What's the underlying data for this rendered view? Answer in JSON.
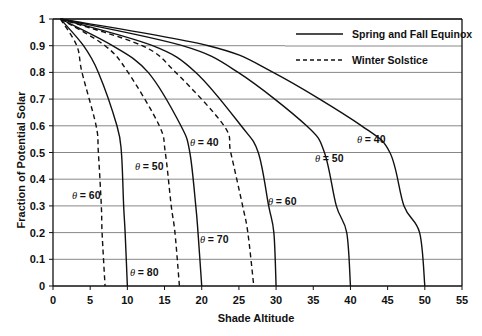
{
  "chart_data": {
    "type": "line",
    "title": "",
    "xlabel": "Shade Altitude",
    "ylabel": "Fraction of Potential Solar",
    "xlim": [
      0,
      55
    ],
    "ylim": [
      0,
      1
    ],
    "xticks": [
      0,
      5,
      10,
      15,
      20,
      25,
      30,
      35,
      40,
      45,
      50,
      55
    ],
    "yticks": [
      0,
      0.1,
      0.2,
      0.3,
      0.4,
      0.5,
      0.6,
      0.7,
      0.8,
      0.9,
      1
    ],
    "ytick_labels": [
      "0",
      "0.1",
      "0.2",
      "0.3",
      "0.4",
      "0.5",
      "0.6",
      "0.7",
      "0.8",
      "0.9",
      "1"
    ],
    "grid": "horizontal",
    "legend_position": "top-right",
    "legend": [
      {
        "label": "Spring and Fall Equinox",
        "style": "solid"
      },
      {
        "label": "Winter Solstice",
        "style": "dashed"
      }
    ],
    "series": [
      {
        "name": "Winter Solstice θ = 60",
        "label": "= 60",
        "style": "dashed",
        "x": [
          1,
          3.2,
          3.9,
          5.8,
          6.1,
          6.5,
          6.6,
          7
        ],
        "y": [
          1,
          0.9,
          0.8,
          0.6,
          0.5,
          0.3,
          0.2,
          0
        ],
        "label_pos": [
          72,
          199
        ]
      },
      {
        "name": "Spring and Fall Equinox θ = 80",
        "label": "= 80",
        "style": "solid",
        "x": [
          1,
          4.1,
          6.1,
          8.6,
          9.2,
          9.5,
          9.7,
          10
        ],
        "y": [
          1,
          0.9,
          0.8,
          0.6,
          0.5,
          0.3,
          0.2,
          0
        ],
        "label_pos": [
          130,
          276
        ]
      },
      {
        "name": "Winter Solstice θ = 50",
        "label": "= 50",
        "style": "dashed",
        "x": [
          1,
          7,
          10.1,
          14.3,
          15.1,
          15.9,
          16.4,
          17
        ],
        "y": [
          1,
          0.9,
          0.8,
          0.6,
          0.5,
          0.3,
          0.2,
          0
        ],
        "label_pos": [
          135,
          170
        ]
      },
      {
        "name": "Spring and Fall Equinox θ = 70",
        "label": "= 70",
        "style": "solid",
        "x": [
          1,
          8,
          12.8,
          17.2,
          18.4,
          19.2,
          19.5,
          20
        ],
        "y": [
          1,
          0.9,
          0.8,
          0.6,
          0.5,
          0.3,
          0.2,
          0
        ],
        "label_pos": [
          200,
          243
        ]
      },
      {
        "name": "Winter Solstice θ = 40",
        "label": "= 40",
        "style": "dashed",
        "x": [
          1,
          12,
          16.5,
          23,
          23.9,
          25.5,
          26.2,
          27
        ],
        "y": [
          1,
          0.9,
          0.8,
          0.6,
          0.5,
          0.3,
          0.2,
          0
        ],
        "label_pos": [
          190,
          146
        ]
      },
      {
        "name": "Spring and Fall Equinox θ = 60",
        "label": "= 60",
        "style": "solid",
        "x": [
          1,
          13.4,
          19.2,
          25.3,
          27.6,
          29,
          29.7,
          30
        ],
        "y": [
          1,
          0.9,
          0.8,
          0.6,
          0.5,
          0.3,
          0.2,
          0
        ],
        "label_pos": [
          268,
          205
        ]
      },
      {
        "name": "Spring and Fall Equinox θ = 50",
        "label": "= 50",
        "style": "solid",
        "x": [
          1,
          17.4,
          24.9,
          34.1,
          36.5,
          38.1,
          39.5,
          40
        ],
        "y": [
          1,
          0.9,
          0.8,
          0.6,
          0.5,
          0.3,
          0.2,
          0
        ],
        "label_pos": [
          315,
          162
        ]
      },
      {
        "name": "Spring and Fall Equinox θ = 40",
        "label": "= 40",
        "style": "solid",
        "x": [
          1,
          20.9,
          29.6,
          41.5,
          45.3,
          47.2,
          49.3,
          50
        ],
        "y": [
          1,
          0.9,
          0.8,
          0.6,
          0.5,
          0.3,
          0.2,
          0
        ],
        "label_pos": [
          357,
          143
        ]
      }
    ]
  },
  "theme": {
    "line_color": "#111111",
    "grid_color": "#888888",
    "axis_color": "#111111",
    "background": "#ffffff"
  }
}
